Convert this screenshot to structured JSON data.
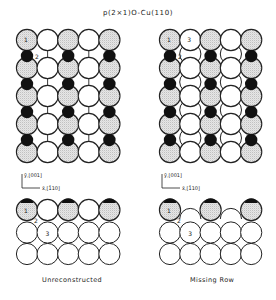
{
  "title": "p(2×1)O-Cu(110)",
  "panels": [
    {
      "id": "unreconstructed",
      "caption": "Unreconstructed",
      "top_view": {
        "columns": 5,
        "rows": 5,
        "shaded_columns": [
          0,
          2,
          4
        ],
        "oxygen_columns": [
          0,
          2,
          4
        ],
        "labels": [
          {
            "text": "1",
            "where": "atom r0c0"
          },
          {
            "text": "2",
            "where": "oxygen r0c0"
          }
        ]
      },
      "axes": {
        "y": "ȳ,[001]",
        "x": "x̄,[1̄10]"
      },
      "side_view": {
        "columns": 5,
        "layers": 3,
        "top_layer_shaded_columns": [
          0,
          2,
          4
        ],
        "top_layer_present_columns": [
          0,
          1,
          2,
          3,
          4
        ],
        "labels": [
          {
            "text": "1",
            "where": "top c0"
          },
          {
            "text": "2",
            "where": "between"
          },
          {
            "text": "3",
            "where": "layer2 c1"
          }
        ]
      }
    },
    {
      "id": "missing-row",
      "caption": "Missing Row",
      "top_view": {
        "columns": 5,
        "rows": 5,
        "shaded_columns": [
          0,
          2,
          4
        ],
        "oxygen_columns": [
          0,
          2,
          4
        ],
        "labels": [
          {
            "text": "1",
            "where": "atom r0c0"
          },
          {
            "text": "3",
            "where": "atom r0c1"
          },
          {
            "text": "2",
            "where": "oxygen r0c0"
          }
        ]
      },
      "axes": {
        "y": "ȳ,[001]",
        "x": "x̄,[1̄10]"
      },
      "side_view": {
        "columns": 5,
        "layers": 3,
        "top_layer_shaded_columns": [
          0,
          2,
          4
        ],
        "top_layer_present_columns": [
          0,
          2,
          4
        ],
        "labels": [
          {
            "text": "1",
            "where": "top c0"
          },
          {
            "text": "2",
            "where": "between"
          },
          {
            "text": "3",
            "where": "layer2 c1"
          }
        ]
      }
    }
  ],
  "colors": {
    "oxygen": "#111111",
    "shaded_cu": "#d4d4d4",
    "cu": "#ffffff",
    "stroke": "#222222"
  }
}
